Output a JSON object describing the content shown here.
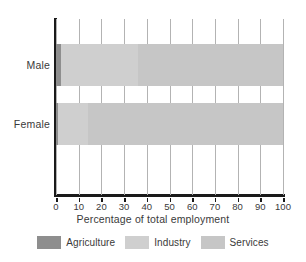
{
  "chart_data": {
    "type": "bar",
    "orientation": "horizontal",
    "stacked": true,
    "title": "",
    "xlabel": "Percentage of total employment",
    "ylabel": "",
    "categories": [
      "Male",
      "Female"
    ],
    "xlim": [
      0,
      100
    ],
    "xticks": [
      0,
      10,
      20,
      30,
      40,
      50,
      60,
      70,
      80,
      90,
      100
    ],
    "xtick_labels": [
      "0",
      "10",
      "20",
      "30",
      "40",
      "50",
      "60",
      "70",
      "80",
      "90",
      "100"
    ],
    "grid": "vertical",
    "legend_position": "bottom",
    "series": [
      {
        "name": "Agriculture",
        "color": "#8e8e8e",
        "values": [
          2,
          1
        ]
      },
      {
        "name": "Industry",
        "color": "#cfcfcf",
        "values": [
          34,
          13
        ]
      },
      {
        "name": "Services",
        "color": "#c6c6c6",
        "values": [
          64,
          86
        ]
      }
    ],
    "annotations": []
  },
  "axis": {
    "x_title": "Percentage of total employment",
    "tick_labels": [
      "0",
      "10",
      "20",
      "30",
      "40",
      "50",
      "60",
      "70",
      "80",
      "90",
      "100"
    ],
    "category_labels": [
      "Male",
      "Female"
    ]
  },
  "legend": {
    "items": [
      {
        "label": "Agriculture",
        "color": "#8e8e8e"
      },
      {
        "label": "Industry",
        "color": "#cfcfcf"
      },
      {
        "label": "Services",
        "color": "#c6c6c6"
      }
    ]
  },
  "colors": {
    "agriculture": "#8e8e8e",
    "industry": "#cfcfcf",
    "services": "#c6c6c6",
    "axis": "#1a1a1a",
    "grid": "#b3b3b3",
    "text": "#3a3a3a",
    "background": "#ffffff"
  }
}
